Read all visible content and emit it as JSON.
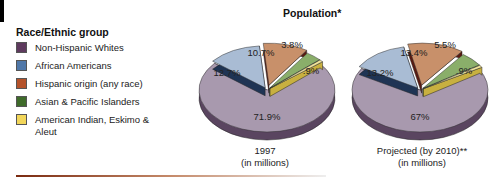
{
  "chart_data": [
    {
      "type": "pie",
      "title": "Population*",
      "caption": [
        "1997",
        "(in millions)"
      ],
      "categories": [
        "Non-Hispanic Whites",
        "African Americans",
        "Hispanic origin (any race)",
        "Asian & Pacific Islanders",
        "American Indian, Eskimo & Aleut"
      ],
      "values": [
        71.9,
        12.7,
        10.7,
        3.8,
        0.9
      ],
      "labels": [
        "71.9%",
        "12.7%",
        "10.7%",
        "3.8%",
        ".9%"
      ]
    },
    {
      "type": "pie",
      "title": "Population*",
      "caption": [
        "Projected (by 2010)**",
        "(in millions)"
      ],
      "categories": [
        "Non-Hispanic Whites",
        "African Americans",
        "Hispanic origin (any race)",
        "Asian & Pacific Islanders",
        "American Indian, Eskimo & Aleut"
      ],
      "values": [
        67,
        13.2,
        13.4,
        5.5,
        0.9
      ],
      "labels": [
        "67%",
        "13.2%",
        "13.4%",
        "5.5%",
        ".9%"
      ]
    }
  ],
  "title": "Population*",
  "legend": {
    "heading": "Race/Ethnic group",
    "items": [
      {
        "label": "Non-Hispanic Whites",
        "color": "#5e3a5e"
      },
      {
        "label": "African Americans",
        "color": "#4f77a8"
      },
      {
        "label": "Hispanic origin (any race)",
        "color": "#b4522a"
      },
      {
        "label": "Asian & Pacific Islanders",
        "color": "#3f6b2a"
      },
      {
        "label": "American Indian, Eskimo & Aleut",
        "color": "#f2d65a"
      }
    ]
  },
  "pie_colors": {
    "top": [
      "#a899ae",
      "#a9bcd4",
      "#c8906a",
      "#8aae6a",
      "#f1e49a"
    ],
    "side": [
      "#5a4560",
      "#1f3454",
      "#5a1a10",
      "#3a6a20",
      "#c8b040"
    ]
  },
  "pie1_caption": {
    "line1": "1997",
    "line2": "(in millions)"
  },
  "pie2_caption": {
    "line1": "Projected (by 2010)**",
    "line2": "(in millions)"
  }
}
